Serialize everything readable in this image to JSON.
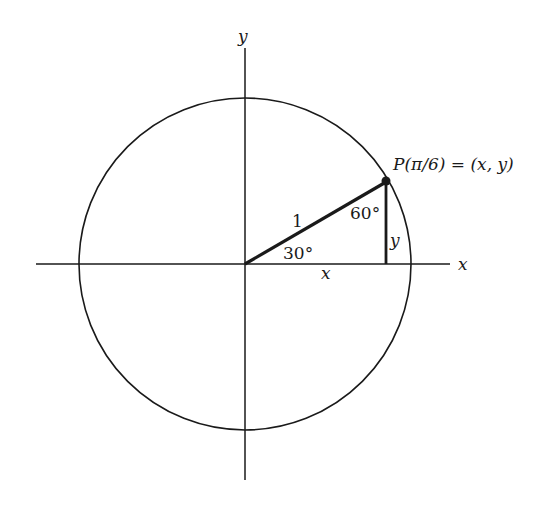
{
  "diagram": {
    "type": "unit-circle",
    "colors": {
      "stroke": "#1a1a1a",
      "background": "#ffffff"
    },
    "axes": {
      "x_label": "x",
      "y_label": "y"
    },
    "point": {
      "label": "P(π/6) = (x, y)",
      "angle_rad": "π/6"
    },
    "radius_label": "1",
    "angles": {
      "at_origin": "30°",
      "at_point": "60°"
    },
    "legs": {
      "horizontal": "x",
      "vertical": "y"
    }
  }
}
